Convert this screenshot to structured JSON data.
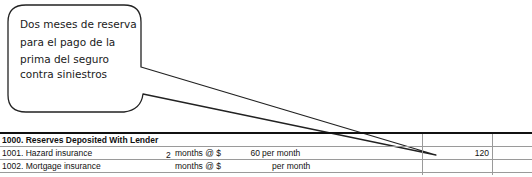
{
  "callout": {
    "lines": [
      "Dos meses de reserva",
      "para el pago de la",
      "prima del seguro",
      "contra siniestros"
    ]
  },
  "section": {
    "header": "1000. Reserves Deposited With Lender",
    "rows": [
      {
        "label": "1001. Hazard insurance",
        "qty": "2",
        "months_label": "months @ $",
        "amount": "60",
        "per_label": "per month",
        "total": "120"
      },
      {
        "label": "1002. Mortgage insurance",
        "qty": "",
        "months_label": "months @ $",
        "amount": "",
        "per_label": "per month",
        "total": ""
      }
    ]
  }
}
